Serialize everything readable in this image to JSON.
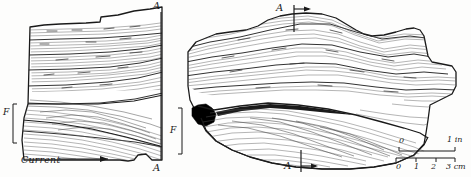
{
  "figure": {
    "background_color": "#fdfdfc",
    "ink_color": "#1a1a1a",
    "lamination_color": "#555555",
    "fill_color": "#ffffff",
    "dark_drape_color": "#000000"
  },
  "labels": {
    "section_A_top_left": "A",
    "section_A_bottom_left": "A",
    "section_A_top_right": "A",
    "section_A_bottom_right": "A",
    "marker_F_left": "F",
    "marker_F_right": "F",
    "current_label": "Current"
  },
  "scale_bar": {
    "inches": {
      "start_label": "0",
      "end_label": "1",
      "unit": "in",
      "end_with_unit": "1 in"
    },
    "centimeters": {
      "ticks": [
        "0",
        "1",
        "2",
        "3"
      ],
      "unit": "cm",
      "end_with_unit": "3 cm"
    }
  },
  "panels": [
    {
      "name": "left-slab",
      "description": "Slab face in section, planar parallel laminations above, inclined cross-lamination set below",
      "section_line": "A-A",
      "bed_marker": "F",
      "current_direction": "right"
    },
    {
      "name": "right-slab",
      "description": "Elongate slab with wavy parallel laminations and a lower lenticular cross-laminated body, dark mud drape at left base",
      "section_line": "A-A"
    }
  ]
}
